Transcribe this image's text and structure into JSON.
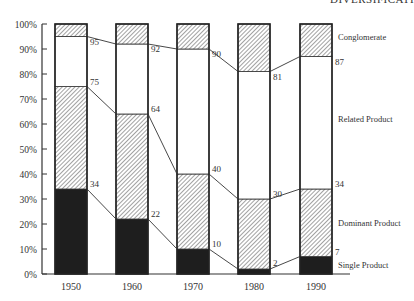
{
  "header": {
    "title": "DIVERSIFICATI"
  },
  "chart_data": {
    "type": "bar",
    "stacked": true,
    "title": "",
    "xlabel": "",
    "ylabel": "",
    "ylim": [
      0,
      100
    ],
    "yticks": [
      "0%",
      "10%",
      "20%",
      "30%",
      "40%",
      "50%",
      "60%",
      "70%",
      "80%",
      "90%",
      "100%"
    ],
    "categories": [
      "1950",
      "1960",
      "1970",
      "1980",
      "1990"
    ],
    "series": [
      {
        "name": "Single Product",
        "values": [
          34,
          22,
          10,
          2,
          7
        ],
        "fill": "dark"
      },
      {
        "name": "Dominant Product",
        "values": [
          41,
          42,
          30,
          28,
          27
        ],
        "fill": "hatch"
      },
      {
        "name": "Related Product",
        "values": [
          20,
          28,
          50,
          51,
          53
        ],
        "fill": "white"
      },
      {
        "name": "Conglomerate",
        "values": [
          5,
          8,
          10,
          19,
          13
        ],
        "fill": "hatch"
      }
    ],
    "cumulative_labels": {
      "single": [
        34,
        22,
        10,
        2,
        7
      ],
      "dominant": [
        75,
        64,
        40,
        30,
        34
      ],
      "related": [
        95,
        92,
        90,
        81,
        87
      ]
    },
    "legend": [
      "Conglomerate",
      "Related Product",
      "Dominant Product",
      "Single Product"
    ],
    "grid": false,
    "legend_position": "right (inline labels)"
  },
  "colors": {
    "dark": "#1e1e1e",
    "hatch": "#555555",
    "axis": "#333333"
  }
}
